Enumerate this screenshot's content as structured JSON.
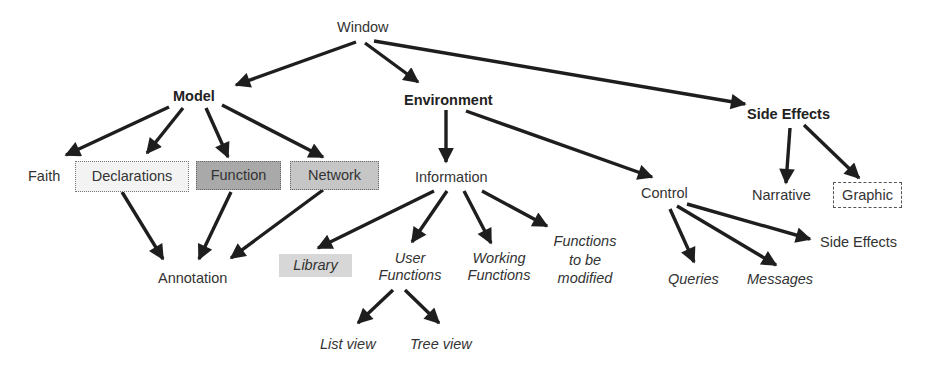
{
  "diagram": {
    "title": "Window",
    "nodes": {
      "window": "Window",
      "model": "Model",
      "environment": "Environment",
      "side_effects_top": "Side Effects",
      "faith": "Faith",
      "declarations": "Declarations",
      "function": "Function",
      "network": "Network",
      "annotation": "Annotation",
      "information": "Information",
      "control": "Control",
      "narrative": "Narrative",
      "graphic": "Graphic",
      "library": "Library",
      "user_functions": [
        "User",
        "Functions"
      ],
      "working_functions": [
        "Working",
        "Functions"
      ],
      "functions_to_be_modified": [
        "Functions",
        "to be",
        "modified"
      ],
      "list_view": "List view",
      "tree_view": "Tree view",
      "queries": "Queries",
      "messages": "Messages",
      "side_effects_control": "Side Effects"
    },
    "box_colors": {
      "declarations": "#f3f3f3",
      "function": "#a9a9a9",
      "network": "#c6c6c6",
      "library": "#d7d7d7",
      "graphic": "#ffffff"
    },
    "edges": [
      [
        "Window",
        "Model"
      ],
      [
        "Window",
        "Environment"
      ],
      [
        "Window",
        "Side Effects"
      ],
      [
        "Model",
        "Faith"
      ],
      [
        "Model",
        "Declarations"
      ],
      [
        "Model",
        "Function"
      ],
      [
        "Model",
        "Network"
      ],
      [
        "Declarations",
        "Annotation"
      ],
      [
        "Function",
        "Annotation"
      ],
      [
        "Network",
        "Annotation"
      ],
      [
        "Environment",
        "Information"
      ],
      [
        "Environment",
        "Control"
      ],
      [
        "Side Effects",
        "Narrative"
      ],
      [
        "Side Effects",
        "Graphic"
      ],
      [
        "Information",
        "Library"
      ],
      [
        "Information",
        "User Functions"
      ],
      [
        "Information",
        "Working Functions"
      ],
      [
        "Information",
        "Functions to be modified"
      ],
      [
        "User Functions",
        "List view"
      ],
      [
        "User Functions",
        "Tree view"
      ],
      [
        "Control",
        "Queries"
      ],
      [
        "Control",
        "Messages"
      ],
      [
        "Control",
        "Side Effects (control)"
      ]
    ]
  }
}
